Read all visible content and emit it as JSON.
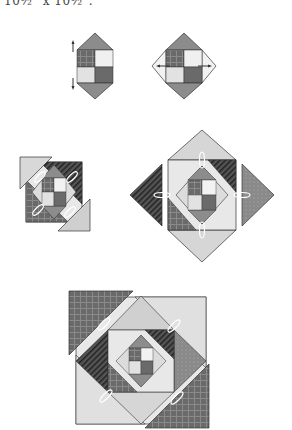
{
  "caption": "10½\" x 10½\".",
  "colors": {
    "dark": "#5a5a5a",
    "medium": "#8c8c8c",
    "light": "#d0d0d0",
    "lighter": "#e6e6e6",
    "white": "#f7f7f7",
    "outline": "#333333"
  },
  "steps": [
    {
      "id": "step-1",
      "description": "Four-patch center with two triangles attached top and bottom"
    },
    {
      "id": "step-2",
      "description": "Add triangles to left and right sides to form a square on point"
    },
    {
      "id": "step-3",
      "description": "Add four corner triangles to make a twisted square"
    },
    {
      "id": "step-4",
      "description": "Add four large triangles to form a larger square on point"
    },
    {
      "id": "step-5",
      "description": "Add final large corner triangles to complete the block"
    }
  ]
}
